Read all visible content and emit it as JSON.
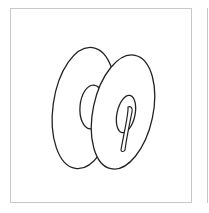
{
  "image": {
    "subject": "spool",
    "description": "Line drawing of a thread spool / bobbin with two discs and a slotted hub hole",
    "colors": {
      "stroke": "#222222",
      "frame": "#c8c8c8",
      "background": "#ffffff"
    }
  }
}
